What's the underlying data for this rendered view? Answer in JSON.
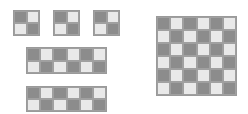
{
  "colors": {
    "dark": "#8c8c8c",
    "light": "#e9e9e9",
    "border": "#9a9a9a"
  },
  "figures": [
    {
      "id": "sq1",
      "name": "small-checker-square-1",
      "rows": 2,
      "cols": 2,
      "pattern": [
        [
          "d",
          "l"
        ],
        [
          "l",
          "d"
        ]
      ]
    },
    {
      "id": "sq2",
      "name": "small-checker-square-2",
      "rows": 2,
      "cols": 2,
      "pattern": [
        [
          "d",
          "l"
        ],
        [
          "l",
          "d"
        ]
      ]
    },
    {
      "id": "sq3",
      "name": "small-checker-square-3",
      "rows": 2,
      "cols": 2,
      "pattern": [
        [
          "d",
          "l"
        ],
        [
          "l",
          "d"
        ]
      ]
    },
    {
      "id": "rect1",
      "name": "checker-rectangle-1",
      "rows": 2,
      "cols": 6,
      "pattern": [
        [
          "d",
          "l",
          "d",
          "l",
          "d",
          "l"
        ],
        [
          "l",
          "d",
          "l",
          "d",
          "l",
          "d"
        ]
      ]
    },
    {
      "id": "rect2",
      "name": "checker-rectangle-2",
      "rows": 2,
      "cols": 6,
      "pattern": [
        [
          "d",
          "l",
          "d",
          "l",
          "d",
          "l"
        ],
        [
          "l",
          "d",
          "l",
          "d",
          "l",
          "d"
        ]
      ]
    },
    {
      "id": "big",
      "name": "large-checker-square",
      "rows": 6,
      "cols": 6,
      "pattern": [
        [
          "d",
          "l",
          "d",
          "l",
          "d",
          "l"
        ],
        [
          "l",
          "d",
          "l",
          "d",
          "l",
          "d"
        ],
        [
          "d",
          "l",
          "d",
          "l",
          "d",
          "l"
        ],
        [
          "l",
          "d",
          "l",
          "d",
          "l",
          "d"
        ],
        [
          "d",
          "l",
          "d",
          "l",
          "d",
          "l"
        ],
        [
          "l",
          "d",
          "l",
          "d",
          "l",
          "d"
        ]
      ]
    }
  ]
}
